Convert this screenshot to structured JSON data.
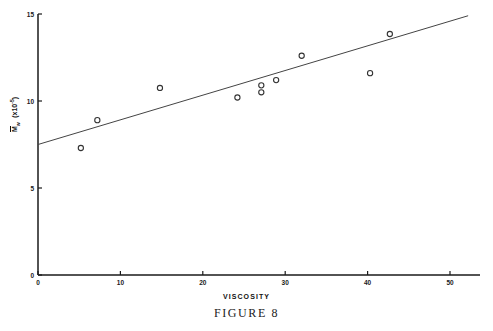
{
  "figure": {
    "caption": "FIGURE 8"
  },
  "chart_data": {
    "type": "scatter",
    "title": "",
    "xlabel": "VISCOSITY",
    "ylabel": "Mw (x10-5)",
    "ylabel_parts": {
      "symbol": "M",
      "subscript": "w",
      "unit": "(x10",
      "exponent": "-5",
      "unit_close": ")"
    },
    "xlim": [
      0,
      50
    ],
    "ylim": [
      0,
      15
    ],
    "xticks": [
      0,
      10,
      20,
      30,
      40,
      50
    ],
    "xtick_labels": [
      "0",
      "10",
      "20",
      "30",
      "40",
      "50"
    ],
    "yticks": [
      0,
      5,
      10,
      15
    ],
    "ytick_labels": [
      "0",
      "5",
      "10",
      "15"
    ],
    "grid": false,
    "legend": null,
    "marker": "open-circle",
    "points": [
      {
        "x": 5.2,
        "y": 7.3
      },
      {
        "x": 7.2,
        "y": 8.9
      },
      {
        "x": 14.8,
        "y": 10.75
      },
      {
        "x": 24.2,
        "y": 10.2
      },
      {
        "x": 27.1,
        "y": 10.9
      },
      {
        "x": 27.1,
        "y": 10.5
      },
      {
        "x": 28.9,
        "y": 11.2
      },
      {
        "x": 32.0,
        "y": 12.6
      },
      {
        "x": 40.3,
        "y": 11.6
      },
      {
        "x": 42.7,
        "y": 13.85
      }
    ],
    "series": [
      {
        "name": "fit-line",
        "type": "line",
        "x": [
          0,
          52.2
        ],
        "y": [
          7.5,
          14.9
        ]
      }
    ]
  },
  "colors": {
    "axis": "#1a1a1a",
    "marker": "#333333",
    "line": "#444444",
    "background": "#ffffff"
  }
}
